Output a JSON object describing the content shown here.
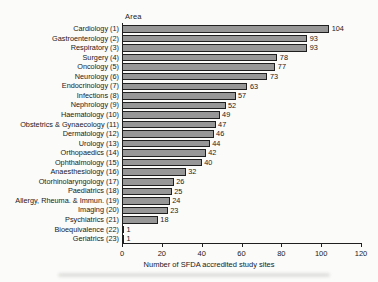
{
  "chart": {
    "area_header": "Area"
  },
  "chart_data": {
    "type": "bar",
    "orientation": "horizontal",
    "title": "",
    "ylabel": "Area",
    "xlabel": "Number of SFDA accredited study sites",
    "categories": [
      "Cardiology (1)",
      "Gastroenterology (2)",
      "Respiratory (3)",
      "Surgery (4)",
      "Oncology (5)",
      "Neurology (6)",
      "Endocrinology (7)",
      "Infections (8)",
      "Nephrology (9)",
      "Haematology (10)",
      "Obstetrics & Gynaecology (11)",
      "Dermatology (12)",
      "Urology (13)",
      "Orthopaedics (14)",
      "Ophthalmology (15)",
      "Anaesthesiology (16)",
      "Otorhinolaryngology (17)",
      "Paediatrics (18)",
      "Allergy, Rheuma. & Immun. (19)",
      "Imaging (20)",
      "Psychiatrics (21)",
      "Bioequivalence (22)",
      "Geriatrics (23)"
    ],
    "values": [
      104,
      93,
      93,
      78,
      77,
      73,
      63,
      57,
      52,
      49,
      47,
      46,
      44,
      42,
      40,
      32,
      26,
      25,
      24,
      23,
      18,
      1,
      1
    ],
    "xlim": [
      0,
      120
    ],
    "xticks": [
      0,
      20,
      40,
      60,
      80,
      100,
      120
    ],
    "value_labels_shown": true,
    "grid": false,
    "legend": "none",
    "bar_fill_color": "#979797",
    "bar_border_color": "#1f1f1f",
    "text_color": "#1a1a1a",
    "background_color": "#fbfbf9"
  }
}
